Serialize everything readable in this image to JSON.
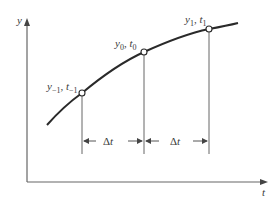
{
  "diagram": {
    "type": "finite-difference-time-step",
    "axes": {
      "y_label": "y",
      "x_label": "t"
    },
    "points": [
      {
        "id": "prev",
        "y_sym": "y",
        "y_sub": "−1",
        "t_sym": "t",
        "t_sub": "−1",
        "label": "y₋₁, t₋₁"
      },
      {
        "id": "curr",
        "y_sym": "y",
        "y_sub": "0",
        "t_sym": "t",
        "t_sub": "0",
        "label": "y₀, t₀"
      },
      {
        "id": "next",
        "y_sym": "y",
        "y_sub": "1",
        "t_sym": "t",
        "t_sub": "1",
        "label": "y₁, t₁"
      }
    ],
    "intervals": [
      {
        "delta": "Δ",
        "var": "t"
      },
      {
        "delta": "Δ",
        "var": "t"
      }
    ],
    "colors": {
      "curve": "#2a2a2a",
      "axis": "#555555",
      "text": "#3a3a3a"
    }
  }
}
